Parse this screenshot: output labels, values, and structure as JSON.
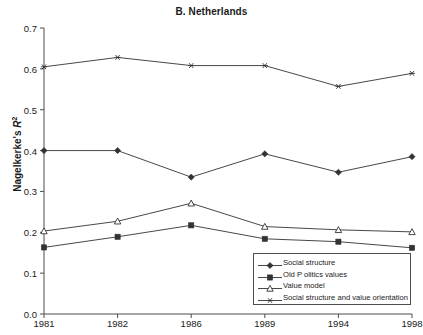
{
  "chart_data": {
    "type": "line",
    "title": "B. Netherlands",
    "xlabel": "",
    "ylabel": "Nagelkerke's R²",
    "categories": [
      "1981",
      "1982",
      "1986",
      "1989",
      "1994",
      "1998"
    ],
    "ylim": [
      0.0,
      0.7
    ],
    "yticks": [
      "0.0",
      "0.1",
      "0.2",
      "0.3",
      "0.4",
      "0.5",
      "0.6",
      "0.7"
    ],
    "ytick_values": [
      0.0,
      0.1,
      0.2,
      0.3,
      0.4,
      0.5,
      0.6,
      0.7
    ],
    "grid": false,
    "legend_position": "bottom-right",
    "series": [
      {
        "name": "Social structure",
        "marker": "filled-diamond",
        "values": [
          0.4,
          0.4,
          0.335,
          0.392,
          0.347,
          0.385
        ]
      },
      {
        "name": "Old P olitics values",
        "marker": "filled-square",
        "values": [
          0.163,
          0.189,
          0.217,
          0.184,
          0.177,
          0.162
        ]
      },
      {
        "name": "Value model",
        "marker": "open-triangle",
        "values": [
          0.203,
          0.227,
          0.271,
          0.214,
          0.206,
          0.201
        ]
      },
      {
        "name": "Social structure and value orientation",
        "marker": "asterisk",
        "values": [
          0.605,
          0.628,
          0.608,
          0.608,
          0.557,
          0.589
        ]
      }
    ],
    "colors": {
      "line": "#333333",
      "axis": "#4d4d4d",
      "text": "#1a1a1a",
      "background": "#ffffff"
    }
  }
}
